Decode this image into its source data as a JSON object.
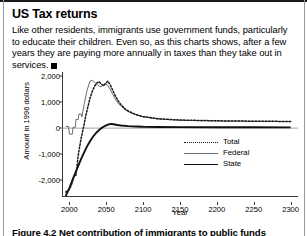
{
  "article": {
    "headline": "US Tax returns",
    "deck": "Like other residents, immigrants use government funds, particularly to educate their children. Even so, as this charts shows, after a few years they are paying more annually in taxes than they take out in services.",
    "end_mark": "square-end-mark"
  },
  "caption": {
    "text": "Figure 4.2   Net contribution of immigrants to public funds"
  },
  "chart_data": {
    "type": "line",
    "title": "",
    "xlabel": "Year",
    "ylabel": "Amount in 1996 dollars",
    "xlim": [
      1990,
      2310
    ],
    "ylim": [
      -2600,
      2150
    ],
    "xticks": [
      "2000",
      "2050",
      "2100",
      "2150",
      "2200",
      "2250",
      "2300"
    ],
    "xtick_values": [
      2000,
      2050,
      2100,
      2150,
      2200,
      2250,
      2300
    ],
    "yticks": [
      "2,000",
      "1,000",
      "0",
      "-1,000",
      "-2,000"
    ],
    "ytick_values": [
      2000,
      1000,
      0,
      -1000,
      -2000
    ],
    "grid": false,
    "legend_position": "center-right",
    "zero_line": true,
    "series": [
      {
        "name": "Total",
        "style": "dotted",
        "color": "#1a1a1a",
        "x": [
          1995,
          2000,
          2003,
          2006,
          2009,
          2012,
          2014,
          2016,
          2018,
          2020,
          2022,
          2025,
          2028,
          2031,
          2034,
          2037,
          2040,
          2043,
          2046,
          2049,
          2052,
          2055,
          2058,
          2062,
          2066,
          2070,
          2075,
          2080,
          2090,
          2100,
          2120,
          2150,
          2200,
          2250,
          2300
        ],
        "values": [
          -2450,
          -2350,
          -2150,
          -1850,
          -1800,
          -1050,
          -700,
          -380,
          -120,
          150,
          450,
          800,
          1150,
          1400,
          1600,
          1720,
          1780,
          1700,
          1620,
          1700,
          1800,
          1680,
          1500,
          1250,
          1050,
          900,
          750,
          650,
          520,
          440,
          360,
          310,
          280,
          265,
          255
        ]
      },
      {
        "name": "Federal",
        "style": "solid-thin",
        "color": "#6d6d6d",
        "x": [
          1995,
          1999,
          2000,
          2001,
          2004,
          2005,
          2008,
          2009,
          2012,
          2013,
          2016,
          2017,
          2020,
          2024,
          2028,
          2031,
          2034,
          2037,
          2040,
          2043,
          2046,
          2049,
          2052,
          2055,
          2058,
          2062,
          2066,
          2070,
          2075,
          2080,
          2090,
          2100,
          2120,
          2150,
          2200,
          2250,
          2300
        ],
        "values": [
          60,
          60,
          -230,
          -230,
          -230,
          30,
          30,
          330,
          330,
          540,
          540,
          430,
          900,
          1450,
          1800,
          1830,
          1760,
          1680,
          1620,
          1580,
          1660,
          1700,
          1640,
          1500,
          1340,
          1130,
          960,
          840,
          720,
          630,
          510,
          430,
          350,
          300,
          275,
          262,
          252
        ]
      },
      {
        "name": "State",
        "style": "solid-thick",
        "color": "#111111",
        "x": [
          1995,
          2000,
          2004,
          2008,
          2012,
          2016,
          2020,
          2024,
          2028,
          2032,
          2036,
          2040,
          2044,
          2048,
          2052,
          2056,
          2060,
          2065,
          2070,
          2080,
          2090,
          2100,
          2120,
          2150,
          2200,
          2250,
          2300
        ],
        "values": [
          -2600,
          -2300,
          -2000,
          -1720,
          -1450,
          -1180,
          -930,
          -700,
          -500,
          -330,
          -190,
          -80,
          10,
          80,
          130,
          160,
          150,
          120,
          100,
          75,
          60,
          50,
          45,
          40,
          35,
          32,
          30
        ]
      }
    ]
  }
}
